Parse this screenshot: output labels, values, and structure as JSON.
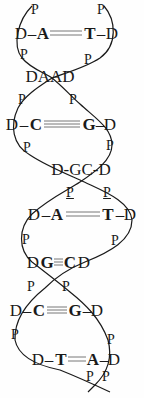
{
  "diagram": {
    "title": "",
    "type": "DNA double helix",
    "colors": {
      "ink": "#1a1a1a",
      "background": "#fefefe"
    },
    "labels": [
      {
        "t": "P",
        "x": 35,
        "y": 10,
        "c": "p"
      },
      {
        "t": "P",
        "x": 101,
        "y": 10,
        "c": "p"
      },
      {
        "t": "D",
        "x": 21,
        "y": 33,
        "c": "d"
      },
      {
        "t": "–",
        "x": 32,
        "y": 33,
        "c": "d"
      },
      {
        "t": "A",
        "x": 43,
        "y": 33,
        "c": "base"
      },
      {
        "t": "T",
        "x": 90,
        "y": 33,
        "c": "base"
      },
      {
        "t": "–",
        "x": 101,
        "y": 33,
        "c": "d"
      },
      {
        "t": "D",
        "x": 112,
        "y": 33,
        "c": "d"
      },
      {
        "t": "P",
        "x": 24,
        "y": 55,
        "c": "p"
      },
      {
        "t": "P",
        "x": 88,
        "y": 60,
        "c": "p"
      },
      {
        "t": "DAAD",
        "x": 50,
        "y": 76,
        "c": "d"
      },
      {
        "t": "P",
        "x": 22,
        "y": 100,
        "c": "p"
      },
      {
        "t": "P",
        "x": 73,
        "y": 100,
        "c": "p"
      },
      {
        "t": "D",
        "x": 12,
        "y": 124,
        "c": "d"
      },
      {
        "t": "–",
        "x": 24,
        "y": 124,
        "c": "d"
      },
      {
        "t": "C",
        "x": 36,
        "y": 124,
        "c": "base"
      },
      {
        "t": "G",
        "x": 89,
        "y": 124,
        "c": "base"
      },
      {
        "t": "–",
        "x": 100,
        "y": 124,
        "c": "d"
      },
      {
        "t": "D",
        "x": 110,
        "y": 124,
        "c": "d"
      },
      {
        "t": "P",
        "x": 27,
        "y": 148,
        "c": "p"
      },
      {
        "t": "P",
        "x": 110,
        "y": 146,
        "c": "p"
      },
      {
        "t": "D-GC-D",
        "x": 81,
        "y": 169,
        "c": "d"
      },
      {
        "t": "P",
        "x": 70,
        "y": 193,
        "c": "p u"
      },
      {
        "t": "P",
        "x": 107,
        "y": 193,
        "c": "p u"
      },
      {
        "t": "D",
        "x": 34,
        "y": 214,
        "c": "d"
      },
      {
        "t": "–",
        "x": 46,
        "y": 214,
        "c": "d"
      },
      {
        "t": "A",
        "x": 57,
        "y": 214,
        "c": "base"
      },
      {
        "t": "T",
        "x": 108,
        "y": 214,
        "c": "base"
      },
      {
        "t": "–",
        "x": 120,
        "y": 214,
        "c": "d"
      },
      {
        "t": "D",
        "x": 130,
        "y": 214,
        "c": "d"
      },
      {
        "t": "P",
        "x": 26,
        "y": 240,
        "c": "p"
      },
      {
        "t": "P",
        "x": 115,
        "y": 241,
        "c": "p"
      },
      {
        "t": "D",
        "x": 33,
        "y": 262,
        "c": "d"
      },
      {
        "t": "G",
        "x": 47,
        "y": 262,
        "c": "base"
      },
      {
        "t": "C",
        "x": 70,
        "y": 262,
        "c": "base"
      },
      {
        "t": "D",
        "x": 84,
        "y": 262,
        "c": "d"
      },
      {
        "t": "P",
        "x": 31,
        "y": 287,
        "c": "p"
      },
      {
        "t": "P",
        "x": 66,
        "y": 287,
        "c": "p"
      },
      {
        "t": "D",
        "x": 16,
        "y": 310,
        "c": "d"
      },
      {
        "t": "–",
        "x": 27,
        "y": 310,
        "c": "d"
      },
      {
        "t": "C",
        "x": 39,
        "y": 310,
        "c": "base"
      },
      {
        "t": "G",
        "x": 75,
        "y": 310,
        "c": "base"
      },
      {
        "t": "–",
        "x": 87,
        "y": 310,
        "c": "d"
      },
      {
        "t": "D",
        "x": 97,
        "y": 310,
        "c": "d"
      },
      {
        "t": "P",
        "x": 15,
        "y": 335,
        "c": "p"
      },
      {
        "t": "P",
        "x": 111,
        "y": 340,
        "c": "p"
      },
      {
        "t": "D",
        "x": 38,
        "y": 359,
        "c": "d"
      },
      {
        "t": "–",
        "x": 49,
        "y": 359,
        "c": "d"
      },
      {
        "t": "T",
        "x": 61,
        "y": 359,
        "c": "base"
      },
      {
        "t": "A",
        "x": 93,
        "y": 359,
        "c": "base"
      },
      {
        "t": "–",
        "x": 104,
        "y": 359,
        "c": "d"
      },
      {
        "t": "D",
        "x": 114,
        "y": 359,
        "c": "d"
      },
      {
        "t": "P",
        "x": 90,
        "y": 377,
        "c": "p"
      },
      {
        "t": "P",
        "x": 106,
        "y": 377,
        "c": "p"
      }
    ],
    "base_pairs": [
      {
        "pair": "A=T",
        "y": 33,
        "x1": 50,
        "x2": 82,
        "lines": 2
      },
      {
        "pair": "C≡G",
        "y": 124,
        "x1": 44,
        "x2": 80,
        "lines": 3
      },
      {
        "pair": "A=T",
        "y": 214,
        "x1": 66,
        "x2": 100,
        "lines": 2
      },
      {
        "pair": "G≡C",
        "y": 262,
        "x1": 54,
        "x2": 63,
        "lines": 3
      },
      {
        "pair": "C≡G",
        "y": 310,
        "x1": 47,
        "x2": 67,
        "lines": 3
      },
      {
        "pair": "T=A",
        "y": 359,
        "x1": 68,
        "x2": 86,
        "lines": 2
      }
    ]
  }
}
